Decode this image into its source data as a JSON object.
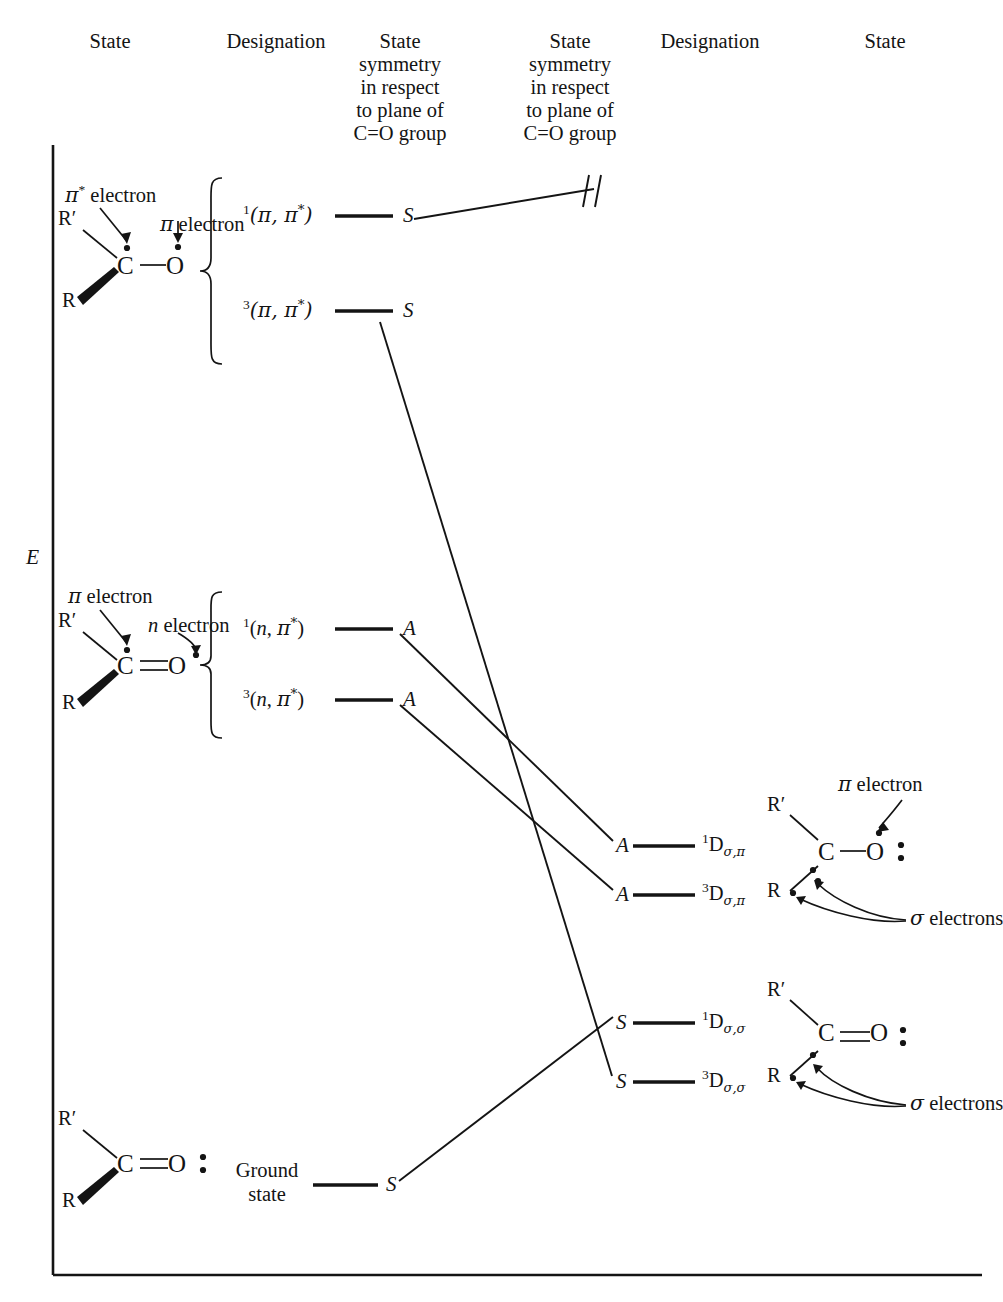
{
  "figure": {
    "type": "state-correlation-diagram",
    "energy_axis_label": "E"
  },
  "headers": [
    {
      "id": "h1",
      "text": "State"
    },
    {
      "id": "h2",
      "text": "Designation"
    },
    {
      "id": "h3",
      "line1": "State",
      "line2": "symmetry",
      "line3": "in respect",
      "line4": "to plane of",
      "line5": "C=O group"
    },
    {
      "id": "h4",
      "line1": "State",
      "line2": "symmetry",
      "line3": "in respect",
      "line4": "to plane of",
      "line5": "C=O group"
    },
    {
      "id": "h5",
      "text": "Designation"
    },
    {
      "id": "h6",
      "text": "State"
    }
  ],
  "left_levels": [
    {
      "id": "pipi_s",
      "multiplicity": "1",
      "orbitals": "(π, π*)",
      "symmetry": "S"
    },
    {
      "id": "pipi_t",
      "multiplicity": "3",
      "orbitals": "(π, π*)",
      "symmetry": "S"
    },
    {
      "id": "npi_s",
      "multiplicity": "1",
      "orbitals": "(n, π*)",
      "symmetry": "A"
    },
    {
      "id": "npi_t",
      "multiplicity": "3",
      "orbitals": "(n, π*)",
      "symmetry": "A"
    },
    {
      "id": "ground",
      "label_line1": "Ground",
      "label_line2": "state",
      "symmetry": "S"
    }
  ],
  "right_levels": [
    {
      "id": "d_sp_s",
      "symmetry": "A",
      "multiplicity": "1",
      "designation": "D",
      "subscript": "σ,π"
    },
    {
      "id": "d_sp_t",
      "symmetry": "A",
      "multiplicity": "3",
      "designation": "D",
      "subscript": "σ,π"
    },
    {
      "id": "d_ss_s",
      "symmetry": "S",
      "multiplicity": "1",
      "designation": "D",
      "subscript": "σ,σ"
    },
    {
      "id": "d_ss_t",
      "symmetry": "S",
      "multiplicity": "3",
      "designation": "D",
      "subscript": "σ,σ"
    }
  ],
  "structures": [
    {
      "id": "struct-pipi",
      "r_prime": "R′",
      "r": "R",
      "c": "C",
      "o": "O",
      "bond": "single",
      "annotations": [
        {
          "text": "π* electron"
        },
        {
          "text": "π electron"
        }
      ]
    },
    {
      "id": "struct-npi",
      "r_prime": "R′",
      "r": "R",
      "c": "C",
      "o": "O",
      "bond": "double",
      "annotations": [
        {
          "text": "π electron"
        },
        {
          "text": "n electron"
        }
      ]
    },
    {
      "id": "struct-d-sigma-pi",
      "r_prime": "R′",
      "r": "R·",
      "c": "C",
      "o": "O:",
      "bond": "single",
      "annotations": [
        {
          "text": "π electron"
        },
        {
          "text": "σ electrons"
        }
      ]
    },
    {
      "id": "struct-d-sigma-sigma",
      "r_prime": "R′",
      "r": "R·",
      "c": "C",
      "o": "O:",
      "bond": "double",
      "annotations": [
        {
          "text": "σ electrons"
        }
      ]
    },
    {
      "id": "struct-ground",
      "r_prime": "R′",
      "r": "R",
      "c": "C",
      "o": "O:",
      "bond": "double",
      "annotations": []
    }
  ],
  "colors": {
    "ink": "#141414",
    "background": "#ffffff"
  }
}
